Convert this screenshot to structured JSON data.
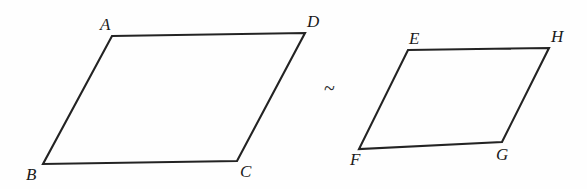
{
  "figure": {
    "background_color": "#fefefe",
    "stroke_color": "#232323",
    "stroke_width": 2.1,
    "label_color": "#1a1a1a",
    "canvas": {
      "width": 587,
      "height": 189
    },
    "relation": {
      "symbol": "~",
      "name": "is-similar-to",
      "x": 324,
      "y": 78
    },
    "shapes": [
      {
        "id": "parallelogram-abcd",
        "name": "parallelogram ABCD",
        "path": "M 112 36 L 305 33 L 237 161 L 43 164 Z",
        "vertices": [
          {
            "label": "A",
            "px": 112,
            "py": 36,
            "lx": 100,
            "ly": 16
          },
          {
            "label": "D",
            "px": 305,
            "py": 33,
            "lx": 307,
            "ly": 13
          },
          {
            "label": "C",
            "px": 237,
            "py": 161,
            "lx": 240,
            "ly": 163
          },
          {
            "label": "B",
            "px": 43,
            "py": 164,
            "lx": 26,
            "ly": 166
          }
        ]
      },
      {
        "id": "parallelogram-efgh",
        "name": "parallelogram EFGH",
        "path": "M 408 50 L 549 48 L 502 142 L 359 149 Z",
        "vertices": [
          {
            "label": "E",
            "px": 408,
            "py": 50,
            "lx": 409,
            "ly": 30
          },
          {
            "label": "H",
            "px": 549,
            "py": 48,
            "lx": 551,
            "ly": 28
          },
          {
            "label": "G",
            "px": 502,
            "py": 142,
            "lx": 496,
            "ly": 146
          },
          {
            "label": "F",
            "px": 359,
            "py": 149,
            "lx": 350,
            "ly": 151
          }
        ]
      }
    ]
  }
}
